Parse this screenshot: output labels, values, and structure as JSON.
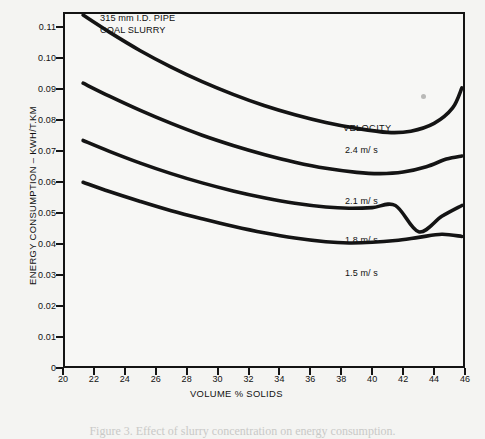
{
  "chart_data": {
    "type": "line",
    "title": "",
    "annotation_lines": [
      "315 mm I.D. PIPE",
      "COAL SLURRY"
    ],
    "xlabel": "VOLUME % SOLIDS",
    "ylabel": "ENERGY CONSUMPTION – KWH/T.KM",
    "xlim": [
      20,
      46
    ],
    "ylim": [
      0,
      0.115
    ],
    "grid": false,
    "legend_title": "VELOCITY",
    "legend_position": "inside-right",
    "xticks": [
      20,
      22,
      24,
      26,
      28,
      30,
      32,
      34,
      36,
      38,
      40,
      42,
      44,
      46
    ],
    "xtick_labels": [
      "20",
      "22",
      "24",
      "26",
      "28",
      "30",
      "32",
      "34",
      "36",
      "38",
      "40",
      "42",
      "44",
      "46"
    ],
    "yticks": [
      0,
      0.01,
      0.02,
      0.03,
      0.04,
      0.05,
      0.06,
      0.07,
      0.08,
      0.09,
      0.1,
      0.11
    ],
    "ytick_labels": [
      "0",
      "0.01",
      "0.02",
      "0.03",
      "0.04",
      "0.05",
      "0.06",
      "0.07",
      "0.08",
      "0.09",
      "0.10",
      "0.11"
    ],
    "series": [
      {
        "name": "2.4 m/ s",
        "label": "2.4 m/ s",
        "x": [
          21.3,
          23,
          25,
          27,
          29,
          31,
          33,
          35,
          37,
          39,
          41,
          42.5,
          44,
          45.2,
          45.8
        ],
        "values": [
          0.114,
          0.1085,
          0.1025,
          0.0972,
          0.0925,
          0.0884,
          0.0848,
          0.0818,
          0.0793,
          0.0774,
          0.0761,
          0.0765,
          0.079,
          0.084,
          0.0905
        ]
      },
      {
        "name": "2.1 m/ s",
        "label": "2.1 m/ s",
        "x": [
          21.3,
          23,
          25,
          27,
          29,
          31,
          33,
          35,
          37,
          39,
          40.5,
          42,
          43.5,
          44.8,
          45.8
        ],
        "values": [
          0.092,
          0.0878,
          0.0832,
          0.079,
          0.0752,
          0.0719,
          0.069,
          0.0665,
          0.0645,
          0.0632,
          0.0628,
          0.0633,
          0.065,
          0.0675,
          0.0685
        ]
      },
      {
        "name": "1.8 m/ s",
        "label": "1.8 m/ s",
        "x": [
          21.3,
          23,
          25,
          27,
          29,
          31,
          33,
          35,
          37,
          38.5,
          40,
          41.5,
          43,
          44.5,
          45.8
        ],
        "values": [
          0.0735,
          0.07,
          0.0662,
          0.0628,
          0.0598,
          0.0572,
          0.055,
          0.0532,
          0.052,
          0.0516,
          0.0518,
          0.0525,
          0.044,
          0.049,
          0.0525
        ]
      },
      {
        "name": "1.5 m/ s",
        "label": "1.5 m/ s",
        "x": [
          21.3,
          23,
          25,
          27,
          29,
          31,
          33,
          35,
          37,
          38.5,
          40,
          41.5,
          43,
          44.5,
          45.8
        ],
        "values": [
          0.06,
          0.057,
          0.0538,
          0.0508,
          0.0482,
          0.0458,
          0.0437,
          0.042,
          0.0408,
          0.0404,
          0.0406,
          0.0412,
          0.0422,
          0.0432,
          0.0425
        ]
      }
    ]
  },
  "plot": {
    "annotation_line1": "315 mm I.D. PIPE",
    "annotation_line2": "COAL SLURRY",
    "legend_title": "VELOCITY",
    "x_axis_title": "VOLUME % SOLIDS",
    "y_axis_title": "ENERGY CONSUMPTION – KWH/T.KM"
  },
  "legend": {
    "items": [
      {
        "label": "2.4 m/ s"
      },
      {
        "label": "2.1 m/ s"
      },
      {
        "label": "1.8 m/ s"
      },
      {
        "label": "1.5 m/ s"
      }
    ]
  },
  "caption": {
    "text": "Figure 3.   Effect of slurry concentration on energy consumption."
  },
  "colors": {
    "page_background": "#f4f4f2",
    "plot_background": "#f7f7f5",
    "axis": "#141414",
    "curve": "#141414",
    "text": "#111111"
  }
}
